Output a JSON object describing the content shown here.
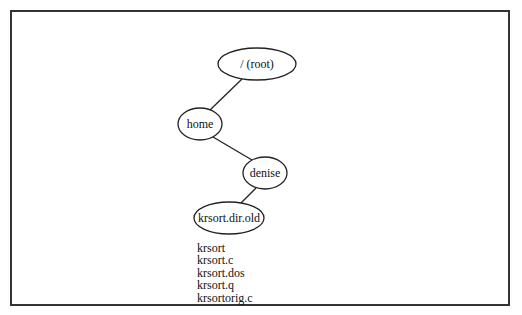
{
  "diagram": {
    "type": "directory-tree",
    "nodes": [
      {
        "id": "root",
        "label": "/ (root)",
        "cx": 257,
        "cy": 64,
        "rx": 39,
        "ry": 16
      },
      {
        "id": "home",
        "label": "home",
        "cx": 200,
        "cy": 124,
        "rx": 22,
        "ry": 16
      },
      {
        "id": "denise",
        "label": "denise",
        "cx": 265,
        "cy": 173,
        "rx": 22,
        "ry": 16
      },
      {
        "id": "krsort_dir_old",
        "label": "krsort.dir.old",
        "cx": 229,
        "cy": 218,
        "rx": 35,
        "ry": 16
      }
    ],
    "edges": [
      {
        "from": "root",
        "to": "home"
      },
      {
        "from": "home",
        "to": "denise"
      },
      {
        "from": "denise",
        "to": "krsort_dir_old"
      }
    ],
    "files": [
      "krsort",
      "krsort.c",
      "krsort.dos",
      "krsort.q",
      "krsortorig.c"
    ]
  }
}
